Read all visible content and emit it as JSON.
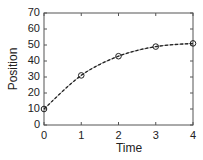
{
  "chart_data": {
    "type": "line",
    "title": "",
    "xlabel": "Time",
    "ylabel": "Position",
    "x": [
      0,
      1,
      2,
      3,
      4
    ],
    "series": [
      {
        "name": "Position",
        "values": [
          10,
          31,
          43,
          49,
          51
        ],
        "marker": "circle",
        "line_style": "dashed",
        "color": "#222222"
      }
    ],
    "xlim": [
      0,
      4
    ],
    "ylim": [
      0,
      70
    ],
    "xticks": [
      "0",
      "1",
      "2",
      "3",
      "4"
    ],
    "yticks": [
      "0",
      "10",
      "20",
      "30",
      "40",
      "50",
      "60",
      "70"
    ],
    "grid": false,
    "legend": null
  }
}
